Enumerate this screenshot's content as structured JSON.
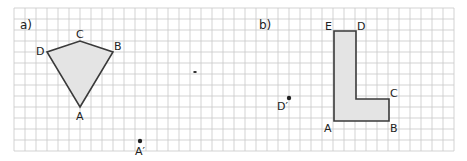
{
  "grid": {
    "origin_x": 14,
    "origin_y": 8,
    "cell": 11,
    "cols": 40,
    "rows": 13,
    "line_color": "#c8c8c8"
  },
  "parts": [
    {
      "id": "a",
      "label": "a)",
      "x": 20,
      "y": 29
    },
    {
      "id": "b",
      "label": "b)",
      "x": 259,
      "y": 29
    }
  ],
  "figures": [
    {
      "name": "kite-ABCD",
      "part": "a",
      "fill": "#e4e4e4",
      "vertices": [
        {
          "label": "A",
          "x": 80,
          "y": 107,
          "lx": 76,
          "ly": 120
        },
        {
          "label": "B",
          "x": 113,
          "y": 52,
          "lx": 114,
          "ly": 50
        },
        {
          "label": "C",
          "x": 80,
          "y": 41,
          "lx": 76,
          "ly": 38
        },
        {
          "label": "D",
          "x": 47,
          "y": 52,
          "lx": 36,
          "ly": 55
        }
      ]
    },
    {
      "name": "l-shape-ABCDE",
      "part": "b",
      "fill": "#e4e4e4",
      "vertices": [
        {
          "label": "A",
          "x": 334,
          "y": 121,
          "lx": 324,
          "ly": 132
        },
        {
          "label": "B",
          "x": 389,
          "y": 121,
          "lx": 390,
          "ly": 132
        },
        {
          "label": "C",
          "x": 389,
          "y": 99,
          "lx": 390,
          "ly": 97
        },
        {
          "label": "",
          "x": 356,
          "y": 99
        },
        {
          "label": "D",
          "x": 356,
          "y": 31,
          "lx": 357,
          "ly": 30
        },
        {
          "label": "E",
          "x": 334,
          "y": 31,
          "lx": 325,
          "ly": 30
        }
      ]
    }
  ],
  "image_points": [
    {
      "label": "A′",
      "x": 140,
      "y": 141,
      "lx": 135,
      "ly": 155
    },
    {
      "label": "D′",
      "x": 289,
      "y": 98,
      "lx": 277,
      "ly": 110
    }
  ],
  "specks": [
    {
      "x": 195,
      "y": 72
    }
  ]
}
